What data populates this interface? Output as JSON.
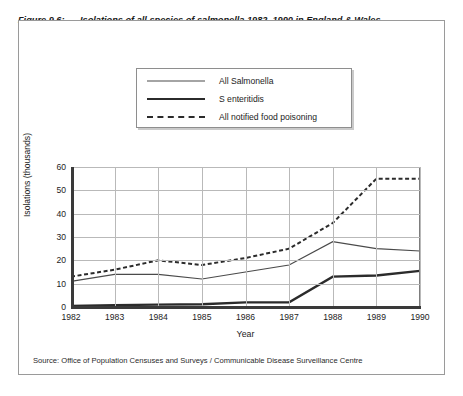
{
  "figure": {
    "label": "Figure 9.6:",
    "caption": "Isolations of all species of salmonella 1982–1990 in England & Wales showing  steady rise plus sharp increase in Salmonella enteritidis",
    "source": "Source: Office of Population Censuses and Surveys / Communicable Disease Surveillance Centre"
  },
  "chart_data": {
    "type": "line",
    "title": "Isolations of all species of salmonella 1982–1990 in England & Wales showing  steady rise plus sharp increase in Salmonella enteritidis",
    "xlabel": "Year",
    "ylabel": "Isolations (thousands)",
    "x": [
      1982,
      1983,
      1984,
      1985,
      1986,
      1987,
      1988,
      1989,
      1990
    ],
    "xtick_labels": [
      "1982",
      "1983",
      "1984",
      "1985",
      "1986",
      "1987",
      "1988",
      "1989",
      "1990"
    ],
    "ytick_labels": [
      "0",
      "10",
      "20",
      "30",
      "40",
      "50",
      "60"
    ],
    "yticks": [
      0,
      10,
      20,
      30,
      40,
      50,
      60
    ],
    "xlim": [
      1982,
      1990
    ],
    "ylim": [
      0,
      60
    ],
    "grid": true,
    "legend_position": "above-plot",
    "series": [
      {
        "name": "All Salmonella",
        "style": "thin-solid",
        "color": "#4a4a4a",
        "values": [
          11,
          14,
          14,
          12,
          15,
          18,
          28,
          25,
          24
        ]
      },
      {
        "name": "S enteritidis",
        "style": "thick-solid",
        "color": "#2b2b2b",
        "values": [
          0.5,
          0.8,
          1.0,
          1.2,
          2.0,
          2.0,
          13,
          13.5,
          15.5
        ]
      },
      {
        "name": "All notified food poisoning",
        "style": "dashed",
        "color": "#2b2b2b",
        "values": [
          13,
          16,
          20,
          18,
          21,
          25,
          36,
          55,
          55
        ]
      }
    ]
  }
}
